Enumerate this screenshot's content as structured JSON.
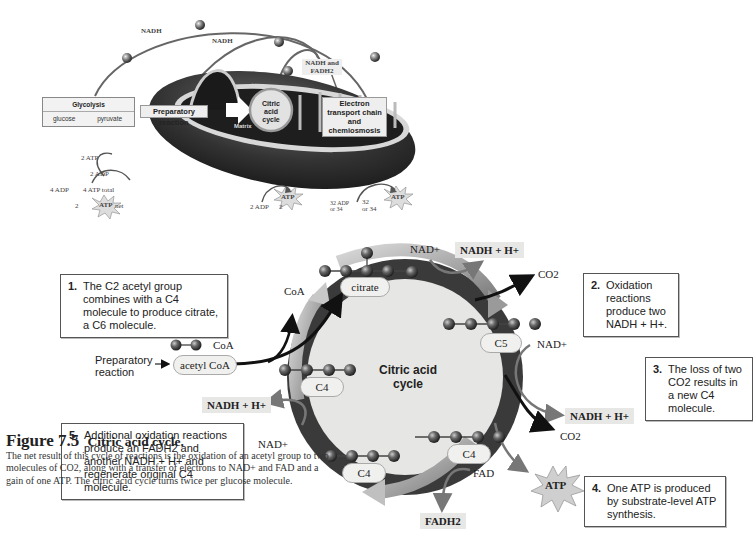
{
  "overview": {
    "arc_labels": [
      "NADH",
      "NADH",
      "NADH and FADH2"
    ],
    "glycolysis": {
      "title": "Glycolysis",
      "reaction_left": "glucose",
      "reaction_right": "pyruvate"
    },
    "preparatory_reaction": "Preparatory reaction",
    "citric_acid_cycle": "Citric acid cycle",
    "matrix": "Matrix",
    "electron_transport": "Electron transport chain and chemiosmosis",
    "glycolysis_atp": {
      "input_atp": "2 ATP",
      "output_adp": "2 ADP",
      "input_adp": "4 ADP",
      "total": "4 ATP total",
      "net_count": "2",
      "net_label": "net",
      "atp": "ATP"
    },
    "cycle_atp": {
      "adp": "2 ADP",
      "count": "2",
      "atp": "ATP"
    },
    "etc_atp": {
      "adp_line1": "32 ADP",
      "adp_line2": "or 34",
      "count_line1": "32",
      "count_line2": "or 34",
      "atp": "ATP"
    }
  },
  "cycle": {
    "center_line1": "Citric acid",
    "center_line2": "cycle",
    "acetyl_coa": "acetyl CoA",
    "coa_attached": "CoA",
    "coa_released": "CoA",
    "preparatory_line1": "Preparatory",
    "preparatory_line2": "reaction",
    "citrate": "citrate",
    "c5": "C5",
    "c4_left": "C4",
    "c4_bottom": "C4",
    "c4_right": "C4",
    "nad_top": "NAD+",
    "nadh_top": "NADH + H+",
    "co2_top": "CO2",
    "nad_right": "NAD+",
    "nadh_right": "NADH + H+",
    "co2_right": "CO2",
    "nad_left": "NAD+",
    "nadh_left": "NADH + H+",
    "fad": "FAD",
    "fadh2": "FADH2",
    "atp": "ATP"
  },
  "steps": [
    {
      "num": "1.",
      "text": "The C2 acetyl group combines with a C4 molecule to produce citrate, a C6 molecule."
    },
    {
      "num": "2.",
      "text": "Oxidation reactions produce two NADH + H+."
    },
    {
      "num": "3.",
      "text": "The loss of two CO2 results in a new C4 molecule."
    },
    {
      "num": "4.",
      "text": "One ATP is produced by substrate-level ATP synthesis."
    },
    {
      "num": "5.",
      "text": "Additional oxidation reactions produce an FADH2 and another NADH + H+ and regenerate original C4 molecule."
    }
  ],
  "caption": {
    "figure": "Figure 7.5",
    "title": "Citric acid cycle.",
    "body": "The net result of this cycle of reactions is the oxidation of an acetyl group to two molecules of CO2, along with a transfer of electrons to NAD+ and FAD and a gain of one ATP. The citric acid cycle turns twice per glucose molecule."
  },
  "colors": {
    "ring_dark": "#3a3a3a",
    "ring_light": "#9a9a9a",
    "center": "#e6e6e4",
    "label_fill": "#ececea",
    "mito_dark": "#2c2c2c"
  }
}
